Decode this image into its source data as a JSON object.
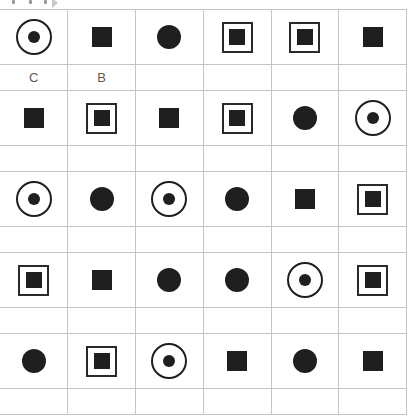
{
  "toolbar": {
    "icons": [
      "toolbar-mark-icon",
      "toolbar-mark-icon",
      "toolbar-mark-icon",
      "toolbar-arrow-icon"
    ]
  },
  "grid": {
    "columns": 6,
    "colors": {
      "shape": "#1f1f1f",
      "gridline": "#c4c4c4",
      "label_text": "#5a5a5a"
    },
    "rows": [
      {
        "type": "shape",
        "cells": [
          "target",
          "square",
          "circle",
          "boxed",
          "boxed",
          "square"
        ]
      },
      {
        "type": "label",
        "cells": [
          "C",
          "B",
          "",
          "",
          "",
          ""
        ]
      },
      {
        "type": "shape",
        "cells": [
          "square",
          "boxed",
          "square",
          "boxed",
          "circle",
          "target"
        ]
      },
      {
        "type": "label",
        "cells": [
          "",
          "",
          "",
          "",
          "",
          ""
        ]
      },
      {
        "type": "shape",
        "cells": [
          "target",
          "circle",
          "target",
          "circle",
          "square",
          "boxed"
        ]
      },
      {
        "type": "label",
        "cells": [
          "",
          "",
          "",
          "",
          "",
          ""
        ]
      },
      {
        "type": "shape",
        "cells": [
          "boxed",
          "square",
          "circle",
          "circle",
          "target",
          "boxed"
        ]
      },
      {
        "type": "label",
        "cells": [
          "",
          "",
          "",
          "",
          "",
          ""
        ]
      },
      {
        "type": "shape",
        "cells": [
          "circle",
          "boxed",
          "target",
          "square",
          "circle",
          "square"
        ]
      },
      {
        "type": "label",
        "cells": [
          "",
          "",
          "",
          "",
          "",
          ""
        ]
      }
    ]
  }
}
